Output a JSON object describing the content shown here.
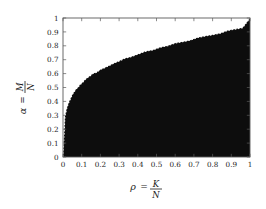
{
  "figure": {
    "name": "phase-diagram",
    "background": "#ffffff",
    "fill_color": "#0d0d0d",
    "axis_color": "#5a5a5a",
    "curve_color": "#ffffff"
  },
  "chart_data": {
    "type": "area",
    "title": "",
    "subtitle": "",
    "xlabel": "ρ = K/N",
    "ylabel": "α = M/N",
    "xlabel_parts": {
      "symbol": "ρ",
      "equals": "=",
      "numerator": "K",
      "denominator": "N"
    },
    "ylabel_parts": {
      "symbol": "α",
      "equals": "=",
      "numerator": "M",
      "denominator": "N"
    },
    "xlim": [
      0,
      1
    ],
    "ylim": [
      0,
      1
    ],
    "grid": false,
    "legend": null,
    "xticks": [
      0,
      0.1,
      0.2,
      0.3,
      0.4,
      0.5,
      0.6,
      0.7,
      0.8,
      0.9,
      1
    ],
    "yticks": [
      0,
      0.1,
      0.2,
      0.3,
      0.4,
      0.5,
      0.6,
      0.7,
      0.8,
      0.9,
      1
    ],
    "xticklabels": [
      "0",
      "0.1",
      "0.2",
      "0.3",
      "0.4",
      "0.5",
      "0.6",
      "0.7",
      "0.8",
      "0.9",
      "1"
    ],
    "yticklabels": [
      "0",
      "0.1",
      "0.2",
      "0.3",
      "0.4",
      "0.5",
      "0.6",
      "0.7",
      "0.8",
      "0.9",
      "1"
    ],
    "series": [
      {
        "name": "phase-boundary",
        "style": "dotted",
        "color": "#ffffff",
        "x": [
          0.0,
          0.01,
          0.02,
          0.03,
          0.04,
          0.05,
          0.06,
          0.07,
          0.08,
          0.09,
          0.1,
          0.12,
          0.14,
          0.16,
          0.18,
          0.2,
          0.22,
          0.25,
          0.28,
          0.3,
          0.33,
          0.36,
          0.4,
          0.44,
          0.48,
          0.52,
          0.56,
          0.6,
          0.64,
          0.68,
          0.72,
          0.76,
          0.8,
          0.84,
          0.88,
          0.92,
          0.96,
          1.0
        ],
        "y": [
          0.0,
          0.29,
          0.35,
          0.39,
          0.42,
          0.45,
          0.47,
          0.49,
          0.5,
          0.52,
          0.53,
          0.56,
          0.58,
          0.6,
          0.61,
          0.63,
          0.64,
          0.66,
          0.68,
          0.69,
          0.71,
          0.72,
          0.74,
          0.76,
          0.77,
          0.79,
          0.8,
          0.82,
          0.83,
          0.84,
          0.86,
          0.87,
          0.88,
          0.89,
          0.91,
          0.92,
          0.93,
          1.0
        ]
      },
      {
        "name": "filled-region",
        "style": "solid-fill",
        "color": "#0d0d0d",
        "description": "region below the boundary curve is filled black"
      }
    ],
    "boundary_model": {
      "form": "alpha = rho^p",
      "p": 0.28
    }
  }
}
